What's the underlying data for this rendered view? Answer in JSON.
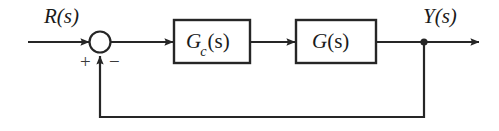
{
  "diagram": {
    "kind": "control-system-block-diagram",
    "colors": {
      "background": "#ffffff",
      "stroke": "#262626",
      "text": "#1a1a1a",
      "sign_text": "#3a3a3a"
    },
    "signals": {
      "input_label": "R(s)",
      "input_var": "R",
      "input_arg": "(s)",
      "output_label": "Y(s)",
      "output_var": "Y",
      "output_arg": "(s)"
    },
    "summing_junction": {
      "name": "summing-junction",
      "plus_sign": "+",
      "minus_sign": "−",
      "plus_input": "reference",
      "minus_input": "feedback",
      "center_x": 100,
      "center_y": 42,
      "radius": 10
    },
    "blocks": [
      {
        "id": "controller",
        "label": "G_c(s)",
        "base": "G",
        "subscript": "c",
        "arg": "(s)",
        "x": 174,
        "y": 20,
        "width": 76,
        "height": 43
      },
      {
        "id": "plant",
        "label": "G(s)",
        "base": "G",
        "subscript": "",
        "arg": "(s)",
        "x": 296,
        "y": 20,
        "width": 80,
        "height": 43
      }
    ],
    "connections": [
      {
        "id": "input-to-sum",
        "from": "R(s)",
        "to": "summing-junction"
      },
      {
        "id": "sum-to-controller",
        "from": "summing-junction",
        "to": "G_c(s)"
      },
      {
        "id": "controller-to-plant",
        "from": "G_c(s)",
        "to": "G(s)"
      },
      {
        "id": "plant-to-output",
        "from": "G(s)",
        "to": "Y(s)"
      },
      {
        "id": "feedback-path",
        "from": "output-node",
        "to": "summing-junction"
      }
    ],
    "takeoff_node": {
      "name": "output-takeoff-node",
      "x": 424,
      "y": 42
    },
    "feedback": {
      "path_y": 117,
      "unity": true
    }
  }
}
